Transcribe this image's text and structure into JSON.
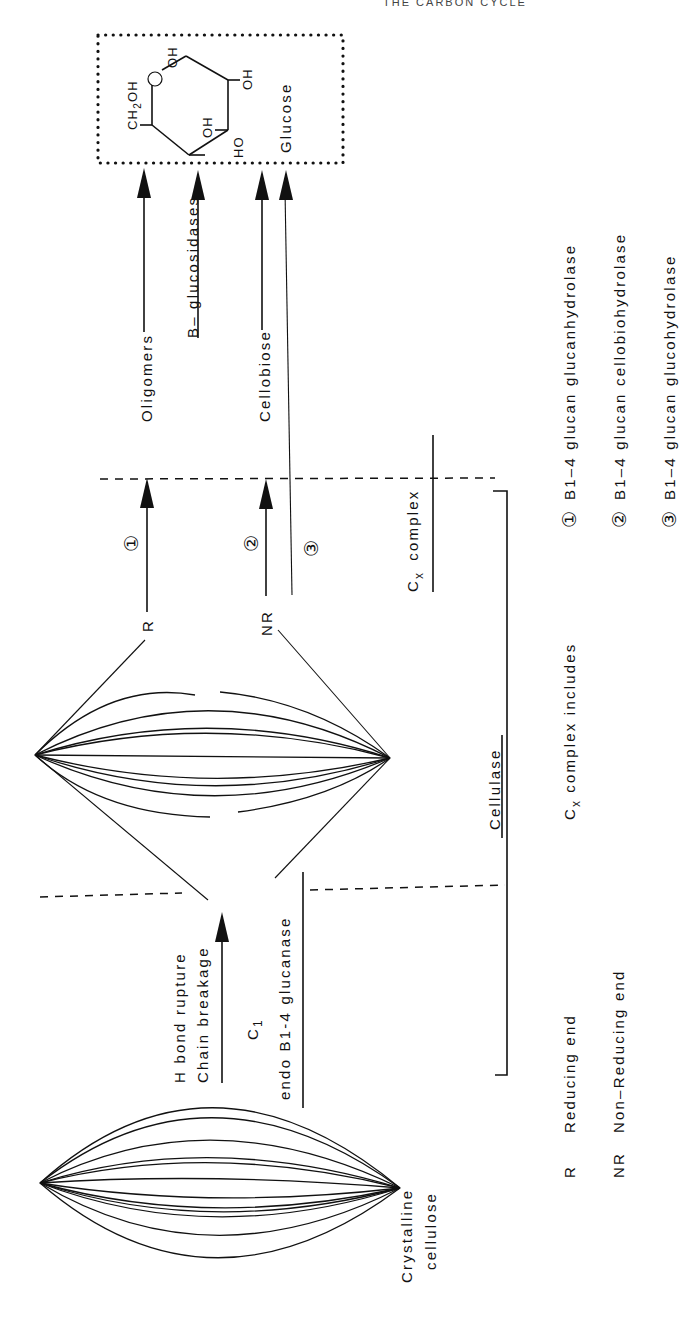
{
  "page": {
    "header": "THE CARBON CYCLE",
    "orientation": "rotated 90deg (text reads bottom-to-top)"
  },
  "structures": {
    "crystalline_cellulose": [
      "Crystalline",
      "cellulose"
    ],
    "glucose": {
      "label": "Glucose",
      "groups": {
        "ch2oh": "CH",
        "ch2oh_sub": "2",
        "ch2oh_tail": "OH",
        "oh_top": "OH",
        "oh_right": "OH",
        "oh_inner": "OH",
        "ho_bottom": "HO"
      }
    }
  },
  "steps": {
    "c1_arrow": {
      "line1": "H bond rupture",
      "line2": "Chain breakage",
      "enzyme": "C",
      "enzyme_sub": "1"
    },
    "endo_label": "endo Β1-4 glucanase",
    "cellulase_label": "Cellulase",
    "cx_label": "C",
    "cx_sub": "x",
    "cx_tail": "complex",
    "ends": {
      "reducing": "R",
      "non_reducing": "NR"
    },
    "markers": [
      "①",
      "②",
      "③"
    ],
    "products": {
      "oligomers": "Oligomers",
      "cellobiose": "Cellobiose",
      "beta_glucosidases": "Β– glucosidases"
    }
  },
  "legend": {
    "ends": [
      {
        "abbr": "R",
        "text": "Reducing  end"
      },
      {
        "abbr": "NR",
        "text": "Non–Reducing  end"
      }
    ],
    "cx_intro": {
      "c": "C",
      "sub": "x",
      "text": "complex  includes"
    },
    "enzymes": [
      {
        "marker": "①",
        "text": "Β1–4  glucan   glucanhydrolase"
      },
      {
        "marker": "②",
        "text": "Β1–4  glucan   cellobiohydrolase"
      },
      {
        "marker": "③",
        "text": "Β1–4  glucan   glucohydrolase"
      }
    ]
  }
}
